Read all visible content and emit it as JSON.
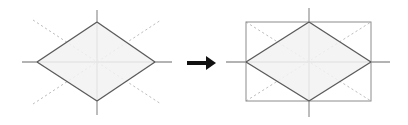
{
  "figure": {
    "background_color": "#ffffff",
    "panel_count": 2,
    "relation_symbol": "→",
    "relation_name": "arrow-right-icon"
  },
  "style": {
    "shape_fill": "#f2f2f2",
    "shape_stroke": "#5a5a5a",
    "shape_stroke_width": 1.3,
    "rect_stroke": "#8c8c8c",
    "rect_stroke_width": 1.0,
    "axis_stroke": "#9a9a9a",
    "axis_stroke_width": 1.3,
    "dotted_stroke": "#bdbdbd",
    "dotted_stroke_width": 1.0,
    "dash_pattern": "2.2 2.6",
    "arrow_color": "#111111"
  },
  "left_panel": {
    "name": "source-figure",
    "label": "rhombus with dotted diagonals",
    "center": {
      "x": 97,
      "y": 62
    },
    "rhombus": {
      "name": "rhombus-shape",
      "vertices": [
        {
          "x": 97,
          "y": 22
        },
        {
          "x": 155,
          "y": 62
        },
        {
          "x": 97,
          "y": 101
        },
        {
          "x": 37,
          "y": 62
        }
      ],
      "half_width": 59,
      "half_height": 40
    },
    "axes": {
      "horizontal": {
        "x1": 22,
        "y1": 62,
        "x2": 172,
        "y2": 62
      },
      "vertical": {
        "x1": 97,
        "y1": 10,
        "x2": 97,
        "y2": 115
      }
    },
    "dotted_diagonals": [
      {
        "name": "dotted-diagonal-down-right",
        "x1": 33,
        "y1": 20,
        "x2": 161,
        "y2": 104
      },
      {
        "name": "dotted-diagonal-up-right",
        "x1": 33,
        "y1": 104,
        "x2": 161,
        "y2": 20
      }
    ],
    "inner_edges": [
      {
        "name": "inner-edge-upper-left",
        "x1": 37,
        "y1": 62,
        "x2": 97,
        "y2": 22
      },
      {
        "name": "inner-edge-upper-right",
        "x1": 97,
        "y1": 22,
        "x2": 155,
        "y2": 62
      },
      {
        "name": "inner-edge-lower-right",
        "x1": 155,
        "y1": 62,
        "x2": 97,
        "y2": 101
      },
      {
        "name": "inner-edge-lower-left",
        "x1": 97,
        "y1": 101,
        "x2": 37,
        "y2": 62
      }
    ]
  },
  "arrow": {
    "name": "transformation-arrow",
    "shaft": {
      "x1": 187,
      "y1": 63,
      "x2": 208,
      "y2": 63
    },
    "shaft_width": 4,
    "head": {
      "tip_x": 216,
      "tip_y": 63,
      "back_x": 206,
      "top_y": 56,
      "bottom_y": 70
    }
  },
  "right_panel": {
    "name": "result-figure",
    "label": "rhombus inscribed in bounding rectangle",
    "center": {
      "x": 309,
      "y": 62
    },
    "bounding_rect": {
      "name": "bounding-rectangle",
      "x": 246,
      "y": 22,
      "width": 125,
      "height": 79
    },
    "rhombus": {
      "name": "rhombus-shape",
      "vertices": [
        {
          "x": 309,
          "y": 22
        },
        {
          "x": 371,
          "y": 62
        },
        {
          "x": 309,
          "y": 101
        },
        {
          "x": 246,
          "y": 62
        }
      ],
      "half_width": 62,
      "half_height": 40
    },
    "axes": {
      "horizontal": {
        "x1": 226,
        "y1": 62,
        "x2": 390,
        "y2": 62
      },
      "vertical": {
        "x1": 309,
        "y1": 8,
        "x2": 309,
        "y2": 117
      }
    },
    "dotted_diagonals": [
      {
        "name": "dotted-diagonal-down-right",
        "x1": 246,
        "y1": 22,
        "x2": 371,
        "y2": 101
      },
      {
        "name": "dotted-diagonal-up-right",
        "x1": 246,
        "y1": 101,
        "x2": 371,
        "y2": 22
      }
    ],
    "inner_edges": [
      {
        "name": "inner-edge-upper-left",
        "x1": 246,
        "y1": 62,
        "x2": 309,
        "y2": 22
      },
      {
        "name": "inner-edge-upper-right",
        "x1": 309,
        "y1": 22,
        "x2": 371,
        "y2": 62
      },
      {
        "name": "inner-edge-lower-right",
        "x1": 371,
        "y1": 62,
        "x2": 309,
        "y2": 101
      },
      {
        "name": "inner-edge-lower-left",
        "x1": 309,
        "y1": 101,
        "x2": 246,
        "y2": 62
      }
    ]
  }
}
